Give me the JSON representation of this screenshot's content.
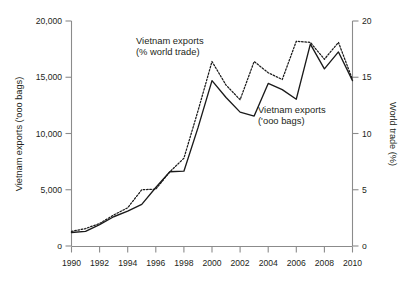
{
  "chart_data": {
    "type": "line",
    "title": "",
    "xlabel": "",
    "ylabel": "Vietnam exports ('ooo bags)",
    "y2label": "World trade (%)",
    "grid": false,
    "legend_position": "inline-annotations",
    "x": [
      1990,
      1991,
      1992,
      1993,
      1994,
      1995,
      1996,
      1997,
      1998,
      1999,
      2000,
      2001,
      2002,
      2003,
      2004,
      2005,
      2006,
      2007,
      2008,
      2009,
      2010
    ],
    "xlim": [
      1990,
      2010
    ],
    "xticks": [
      1990,
      1992,
      1994,
      1996,
      1998,
      2000,
      2002,
      2004,
      2006,
      2008,
      2010
    ],
    "xticklabels": [
      "1990",
      "1992",
      "1994",
      "1996",
      "1998",
      "2000",
      "2002",
      "2004",
      "2006",
      "2008",
      "2010"
    ],
    "ylim": [
      0,
      20000
    ],
    "yticks": [
      0,
      5000,
      10000,
      15000,
      20000
    ],
    "yticklabels": [
      "o",
      "5,000",
      "10,000",
      "15,000",
      "20,000"
    ],
    "y2lim": [
      0,
      20
    ],
    "y2ticks": [
      0,
      5,
      10,
      15,
      20
    ],
    "y2ticklabels": [
      "o",
      "5",
      "10",
      "15",
      "20"
    ],
    "series": [
      {
        "name": "Vietnam exports ('ooo bags)",
        "axis": "left",
        "style": "solid",
        "color": "#1a1a1a",
        "values": [
          1200,
          1300,
          1900,
          2600,
          3100,
          3700,
          5200,
          6600,
          6650,
          10500,
          14700,
          13200,
          11900,
          11550,
          14450,
          13900,
          13050,
          17950,
          15750,
          17250,
          14700
        ]
      },
      {
        "name": "Vietnam exports (% world trade)",
        "axis": "right",
        "style": "dotted",
        "color": "#1a1a1a",
        "values": [
          1.3,
          1.55,
          2.0,
          2.75,
          3.4,
          5.0,
          5.05,
          6.6,
          7.8,
          12.0,
          16.4,
          14.3,
          13.0,
          16.4,
          15.4,
          14.8,
          18.2,
          18.1,
          16.6,
          18.1,
          14.8
        ]
      }
    ],
    "annotations": [
      {
        "id": "annotation-percent-world-trade",
        "lines": [
          "Vietnam exports",
          "(% world trade)"
        ],
        "x": 136,
        "y": 44
      },
      {
        "id": "annotation-ooo-bags",
        "lines": [
          "Vietnam exports",
          "('ooo bags)"
        ],
        "x": 258,
        "y": 113
      }
    ]
  },
  "axis": {
    "left_title": "Vietnam exports ('ooo bags)",
    "right_title": "World trade (%)"
  }
}
